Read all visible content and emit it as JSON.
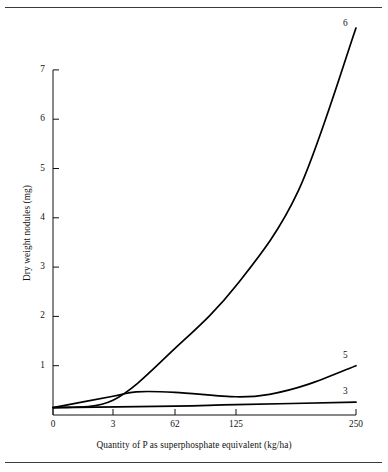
{
  "figure": {
    "top_rule": "horizontal-rule",
    "bottom_rule": "horizontal-rule"
  },
  "chart_data": {
    "type": "line",
    "title": "",
    "xlabel": "Quantity of P as superphosphate equivalent (kg/ha)",
    "ylabel": "Dry weight nodules (mg)",
    "xlim": [
      0,
      250
    ],
    "ylim": [
      0,
      7.4
    ],
    "x_tick_labels": [
      "0",
      "3",
      "62",
      "125",
      "250"
    ],
    "x_tick_values": [
      0,
      3,
      62,
      125,
      250
    ],
    "x_tick_positions_px": [
      53,
      113,
      175,
      236,
      356
    ],
    "y_tick_labels": [
      "1",
      "2",
      "3",
      "4",
      "5",
      "6",
      "7"
    ],
    "y_tick_values": [
      1,
      2,
      3,
      4,
      5,
      6,
      7
    ],
    "grid": false,
    "legend": "inline-end-labels",
    "axis_color": "#111111",
    "line_color": "#000000",
    "series": [
      {
        "name": "6",
        "label": "6",
        "points": [
          [
            0,
            0.15
          ],
          [
            3,
            0.3
          ],
          [
            62,
            1.35
          ],
          [
            125,
            2.62
          ],
          [
            190,
            4.55
          ],
          [
            250,
            7.85
          ]
        ]
      },
      {
        "name": "5",
        "label": "5",
        "points": [
          [
            0,
            0.15
          ],
          [
            3,
            0.38
          ],
          [
            25,
            0.47
          ],
          [
            62,
            0.46
          ],
          [
            125,
            0.37
          ],
          [
            160,
            0.42
          ],
          [
            200,
            0.62
          ],
          [
            250,
            1.0
          ]
        ]
      },
      {
        "name": "3",
        "label": "3",
        "points": [
          [
            0,
            0.15
          ],
          [
            62,
            0.18
          ],
          [
            125,
            0.21
          ],
          [
            250,
            0.26
          ]
        ]
      }
    ]
  }
}
